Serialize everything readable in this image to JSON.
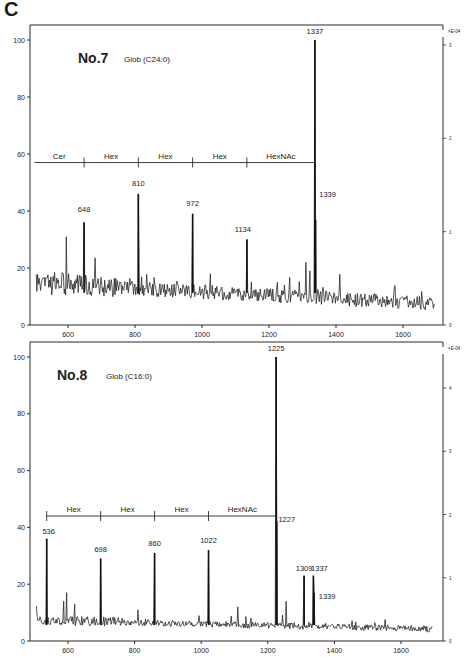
{
  "figure": {
    "panel_label": "C"
  },
  "chart_data": [
    {
      "type": "line",
      "id": "no7",
      "title": "No.7",
      "subtitle": "Glob (C24:0)",
      "xlabel": "",
      "ylabel": "",
      "xlim": [
        500,
        1700
      ],
      "ylim": [
        0,
        100
      ],
      "x_ticks": [
        600,
        800,
        1000,
        1200,
        1400,
        1600
      ],
      "y_ticks": [
        0,
        20,
        40,
        60,
        80,
        100
      ],
      "right_axis": {
        "label": "×E-04",
        "ticks": [
          0,
          1,
          2,
          3
        ]
      },
      "grid": false,
      "labeled_peaks": [
        {
          "mz": 648,
          "label": "648",
          "intensity": 36
        },
        {
          "mz": 810,
          "label": "810",
          "intensity": 46
        },
        {
          "mz": 972,
          "label": "972",
          "intensity": 39
        },
        {
          "mz": 1134,
          "label": "1134",
          "intensity": 30
        },
        {
          "mz": 1337,
          "label": "1337",
          "intensity": 100
        },
        {
          "mz": 1339,
          "label": "1339",
          "intensity": 37
        }
      ],
      "unlabeled_peaks": [
        {
          "mz": 595,
          "intensity": 31
        },
        {
          "mz": 1025,
          "intensity": 18
        },
        {
          "mz": 1225,
          "intensity": 15
        },
        {
          "mz": 1310,
          "intensity": 22
        },
        {
          "mz": 1322,
          "intensity": 19
        }
      ],
      "baseline": {
        "start_intensity": 14,
        "end_intensity": 7
      },
      "fragment_ladder": {
        "y_level": 57,
        "segments": [
          {
            "label": "Cer",
            "from": 500,
            "to": 648
          },
          {
            "label": "Hex",
            "from": 648,
            "to": 810
          },
          {
            "label": "Hex",
            "from": 810,
            "to": 972
          },
          {
            "label": "Hex",
            "from": 972,
            "to": 1134
          },
          {
            "label": "HexNAc",
            "from": 1134,
            "to": 1337
          }
        ]
      }
    },
    {
      "type": "line",
      "id": "no8",
      "title": "No.8",
      "subtitle": "Glob (C16:0)",
      "xlabel": "",
      "ylabel": "",
      "xlim": [
        500,
        1700
      ],
      "ylim": [
        0,
        100
      ],
      "x_ticks": [
        600,
        800,
        1000,
        1200,
        1400,
        1600
      ],
      "y_ticks": [
        0,
        20,
        40,
        60,
        80,
        100
      ],
      "right_axis": {
        "label": "×E-04",
        "ticks": [
          0,
          1,
          2,
          3,
          4
        ]
      },
      "grid": false,
      "labeled_peaks": [
        {
          "mz": 536,
          "label": "536",
          "intensity": 36
        },
        {
          "mz": 698,
          "label": "698",
          "intensity": 29
        },
        {
          "mz": 860,
          "label": "860",
          "intensity": 31
        },
        {
          "mz": 1022,
          "label": "1022",
          "intensity": 32
        },
        {
          "mz": 1225,
          "label": "1225",
          "intensity": 100
        },
        {
          "mz": 1227,
          "label": "1227",
          "intensity": 42
        },
        {
          "mz": 1309,
          "label": "1309",
          "intensity": 23
        },
        {
          "mz": 1337,
          "label": "1337",
          "intensity": 23
        },
        {
          "mz": 1339,
          "label": "1339",
          "intensity": 17
        }
      ],
      "unlabeled_peaks": [
        {
          "mz": 587,
          "intensity": 14
        },
        {
          "mz": 596,
          "intensity": 17
        },
        {
          "mz": 620,
          "intensity": 13
        },
        {
          "mz": 810,
          "intensity": 11
        },
        {
          "mz": 1110,
          "intensity": 12
        },
        {
          "mz": 1255,
          "intensity": 14
        }
      ],
      "baseline": {
        "start_intensity": 7,
        "end_intensity": 4
      },
      "fragment_ladder": {
        "y_level": 44,
        "segments": [
          {
            "label": "Hex",
            "from": 536,
            "to": 698
          },
          {
            "label": "Hex",
            "from": 698,
            "to": 860
          },
          {
            "label": "Hex",
            "from": 860,
            "to": 1022
          },
          {
            "label": "HexNAc",
            "from": 1022,
            "to": 1225
          }
        ]
      }
    }
  ]
}
